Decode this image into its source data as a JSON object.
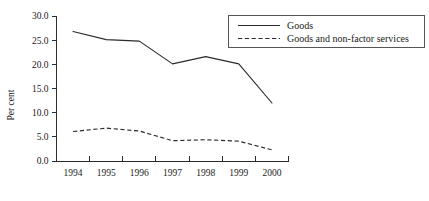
{
  "chart_data": {
    "type": "line",
    "title": "",
    "xlabel": "",
    "ylabel": "Per cent",
    "x": [
      "1994",
      "1995",
      "1996",
      "1997",
      "1998",
      "1999",
      "2000"
    ],
    "categories": [
      "1994",
      "1995",
      "1996",
      "1997",
      "1998",
      "1999",
      "2000"
    ],
    "ylim": [
      0.0,
      30.0
    ],
    "yticks": [
      "0.0",
      "5.0",
      "10.0",
      "15.0",
      "20.0",
      "25.0",
      "30.0"
    ],
    "ytick_values": [
      0.0,
      5.0,
      10.0,
      15.0,
      20.0,
      25.0,
      30.0
    ],
    "grid": false,
    "legend_position": "top-right",
    "series": [
      {
        "name": "Goods",
        "style": "solid",
        "color": "#2b2b2b",
        "values": [
          26.8,
          25.1,
          24.8,
          20.1,
          21.6,
          20.1,
          12.0
        ]
      },
      {
        "name": "Goods and non-factor services",
        "style": "dashed",
        "color": "#2b2b2b",
        "values": [
          6.1,
          6.8,
          6.2,
          4.2,
          4.4,
          4.1,
          2.3
        ]
      }
    ]
  },
  "axes": {
    "y_axis_label": "Per cent"
  },
  "legend": {
    "entries": [
      {
        "label": "Goods",
        "style": "solid"
      },
      {
        "label": "Goods and non-factor services",
        "style": "dashed"
      }
    ]
  }
}
